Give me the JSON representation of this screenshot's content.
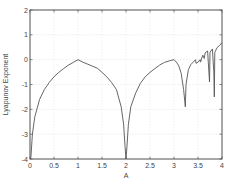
{
  "chart_data": {
    "type": "line",
    "title": "",
    "xlabel": "A",
    "ylabel": "Lyapunov Exponent",
    "xlim": [
      0,
      4
    ],
    "ylim": [
      -4,
      2
    ],
    "xticks": [
      0,
      0.5,
      1,
      1.5,
      2,
      2.5,
      3,
      3.5,
      4
    ],
    "xtick_labels": [
      "0",
      "0.5",
      "1",
      "1.5",
      "2",
      "2.5",
      "3",
      "3.5",
      "4"
    ],
    "yticks": [
      -4,
      -3,
      -2,
      -1,
      0,
      1,
      2
    ],
    "ytick_labels": [
      "-4",
      "-3",
      "-2",
      "-1",
      "0",
      "1",
      "2"
    ],
    "grid": true,
    "legend": null,
    "series": [
      {
        "name": "Lyapunov exponent",
        "color": "#555555",
        "x": [
          0.01,
          0.02,
          0.05,
          0.1,
          0.2,
          0.3,
          0.4,
          0.5,
          0.6,
          0.7,
          0.8,
          0.9,
          1.0,
          1.1,
          1.2,
          1.3,
          1.4,
          1.5,
          1.6,
          1.7,
          1.8,
          1.9,
          1.95,
          1.98,
          2.0,
          2.02,
          2.05,
          2.1,
          2.2,
          2.3,
          2.4,
          2.5,
          2.6,
          2.7,
          2.8,
          2.9,
          3.0,
          3.05,
          3.1,
          3.15,
          3.2,
          3.236,
          3.25,
          3.3,
          3.35,
          3.4,
          3.449,
          3.46,
          3.5,
          3.544,
          3.55,
          3.564,
          3.57,
          3.6,
          3.63,
          3.65,
          3.7,
          3.74,
          3.75,
          3.8,
          3.83,
          3.84,
          3.85,
          3.9,
          3.95,
          4.0
        ],
        "y": [
          -4.0,
          -3.9,
          -3.0,
          -2.3,
          -1.6,
          -1.2,
          -0.92,
          -0.69,
          -0.51,
          -0.36,
          -0.22,
          -0.11,
          0.0,
          -0.1,
          -0.18,
          -0.26,
          -0.34,
          -0.51,
          -0.69,
          -0.92,
          -1.2,
          -1.9,
          -2.6,
          -3.5,
          -4.0,
          -3.5,
          -2.6,
          -1.9,
          -1.35,
          -0.95,
          -0.69,
          -0.51,
          -0.36,
          -0.22,
          -0.11,
          -0.05,
          0.0,
          -0.1,
          -0.25,
          -0.55,
          -1.2,
          -1.9,
          -1.0,
          -0.4,
          -0.2,
          -0.1,
          0.0,
          -0.15,
          -0.1,
          0.0,
          -0.1,
          -0.05,
          0.02,
          0.18,
          0.05,
          0.28,
          0.35,
          -0.9,
          0.3,
          0.43,
          -0.5,
          -1.5,
          0.3,
          0.49,
          0.57,
          0.69
        ]
      }
    ],
    "annotations": []
  },
  "layout": {
    "plot_left": 30,
    "plot_top": 10,
    "plot_right": 222,
    "plot_bottom": 159,
    "axis_color": "#555555",
    "grid_color": "#e2e2e2",
    "line_color": "#555555"
  }
}
